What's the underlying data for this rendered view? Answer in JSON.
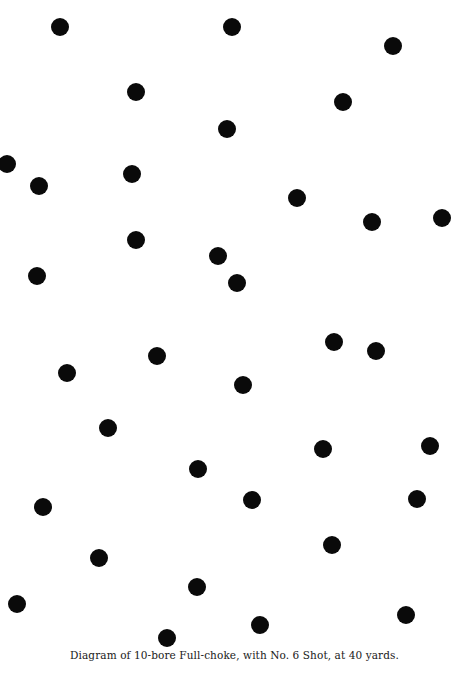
{
  "caption": "Diagram of 10-bore Full-choke, with No. 6 Shot, at 40 yards.",
  "colors": {
    "pellet": "#0a0a0a",
    "background": "#ffffff",
    "text": "#1a1a1a"
  },
  "pellet_diameter_px": 18,
  "pellet_count": 40,
  "pellets": [
    {
      "x": 60,
      "y": 27
    },
    {
      "x": 232,
      "y": 27
    },
    {
      "x": 393,
      "y": 46
    },
    {
      "x": 136,
      "y": 92
    },
    {
      "x": 343,
      "y": 102
    },
    {
      "x": 227,
      "y": 129
    },
    {
      "x": 7,
      "y": 164
    },
    {
      "x": 39,
      "y": 186
    },
    {
      "x": 132,
      "y": 174
    },
    {
      "x": 297,
      "y": 198
    },
    {
      "x": 372,
      "y": 222
    },
    {
      "x": 442,
      "y": 218
    },
    {
      "x": 136,
      "y": 240
    },
    {
      "x": 218,
      "y": 256
    },
    {
      "x": 237,
      "y": 283
    },
    {
      "x": 37,
      "y": 276
    },
    {
      "x": 334,
      "y": 342
    },
    {
      "x": 376,
      "y": 351
    },
    {
      "x": 157,
      "y": 356
    },
    {
      "x": 67,
      "y": 373
    },
    {
      "x": 243,
      "y": 385
    },
    {
      "x": 108,
      "y": 428
    },
    {
      "x": 323,
      "y": 449
    },
    {
      "x": 430,
      "y": 446
    },
    {
      "x": 198,
      "y": 469
    },
    {
      "x": 252,
      "y": 500
    },
    {
      "x": 417,
      "y": 499
    },
    {
      "x": 43,
      "y": 507
    },
    {
      "x": 332,
      "y": 545
    },
    {
      "x": 99,
      "y": 558
    },
    {
      "x": 197,
      "y": 587
    },
    {
      "x": 17,
      "y": 604
    },
    {
      "x": 406,
      "y": 615
    },
    {
      "x": 260,
      "y": 625
    },
    {
      "x": 167,
      "y": 638
    }
  ]
}
